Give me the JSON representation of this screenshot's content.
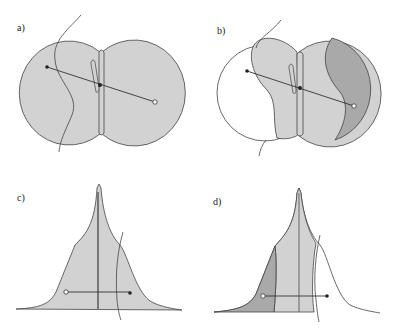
{
  "panels": [
    {
      "id": "a",
      "label": "a)"
    },
    {
      "id": "b",
      "label": "b)"
    },
    {
      "id": "c",
      "label": "c)"
    },
    {
      "id": "d",
      "label": "d)"
    }
  ],
  "colors": {
    "light_fill": "#d2d2d2",
    "dark_fill": "#a9a9a9",
    "stroke": "#444444",
    "background": "#ffffff"
  }
}
